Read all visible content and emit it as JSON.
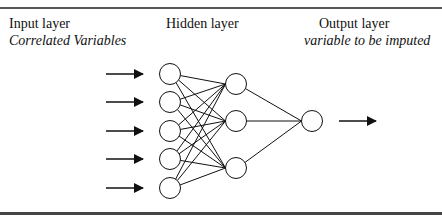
{
  "diagram": {
    "type": "neural-network",
    "layers": [
      {
        "name": "input",
        "title": "Input layer",
        "subtitle": "Correlated Variables",
        "node_count": 5
      },
      {
        "name": "hidden",
        "title": "Hidden layer",
        "subtitle": "",
        "node_count": 3
      },
      {
        "name": "output",
        "title": "Output layer",
        "subtitle": "variable to be imputed",
        "node_count": 1
      }
    ],
    "connections": "fully-connected",
    "input_arrows": 5,
    "output_arrows": 1,
    "colors": {
      "stroke": "#111111",
      "rule": "#555555",
      "background": "#ffffff"
    }
  }
}
